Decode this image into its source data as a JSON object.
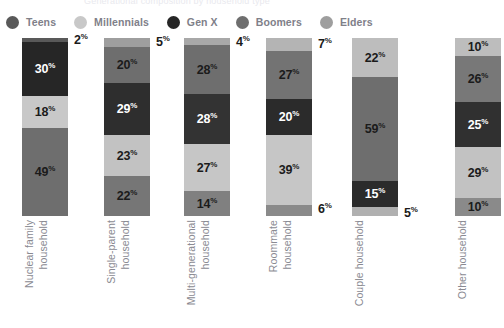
{
  "chart_data": {
    "type": "bar",
    "subtype": "stacked-100-vertical",
    "title": "Generational composition by household type",
    "xlabel": "",
    "ylabel": "",
    "ylim": [
      0,
      100
    ],
    "grid": false,
    "legend_position": "top-left",
    "units": "%",
    "categories": [
      "Nuclear family household",
      "Single-parent household",
      "Multi-generational household",
      "Roommate household",
      "Couple household",
      "Other household"
    ],
    "category_lines": [
      [
        "Nuclear family",
        "household"
      ],
      [
        "Single-parent",
        "household"
      ],
      [
        "Multi-generational",
        "household"
      ],
      [
        "Roommate",
        "household"
      ],
      [
        "Couple household"
      ],
      [
        "Other household"
      ]
    ],
    "series": [
      {
        "name": "Teens",
        "color": "#595959",
        "values": [
          2,
          5,
          4,
          7,
          0,
          10
        ]
      },
      {
        "name": "Millennials",
        "color": "#c8c8c8",
        "values": [
          18,
          23,
          27,
          39,
          22,
          29
        ]
      },
      {
        "name": "Gen X",
        "color": "#262626",
        "values": [
          30,
          29,
          28,
          20,
          15,
          25
        ]
      },
      {
        "name": "Boomers",
        "color": "#6e6e6e",
        "values": [
          49,
          20,
          28,
          27,
          59,
          26
        ]
      },
      {
        "name": "Elders",
        "color": "#9e9e9e",
        "values": [
          0,
          22,
          14,
          6,
          5,
          10
        ]
      }
    ],
    "stacks": [
      {
        "category": "Nuclear family household",
        "segments": [
          {
            "series": "Teens",
            "value": 2,
            "label": "2",
            "color": "#595959",
            "label_inside": false,
            "label_color": "dark"
          },
          {
            "series": "Gen X",
            "value": 30,
            "label": "30",
            "color": "#262626",
            "label_inside": true,
            "label_color": "light"
          },
          {
            "series": "Millennials",
            "value": 18,
            "label": "18",
            "color": "#c8c8c8",
            "label_inside": true,
            "label_color": "dark"
          },
          {
            "series": "Boomers",
            "value": 49,
            "label": "49",
            "color": "#6e6e6e",
            "label_inside": true,
            "label_color": "dark"
          }
        ]
      },
      {
        "category": "Single-parent household",
        "segments": [
          {
            "series": "Teens",
            "value": 5,
            "label": "5",
            "color": "#9e9e9e",
            "label_inside": false,
            "label_color": "dark"
          },
          {
            "series": "Boomers",
            "value": 20,
            "label": "20",
            "color": "#6e6e6e",
            "label_inside": true,
            "label_color": "dark"
          },
          {
            "series": "Gen X",
            "value": 29,
            "label": "29",
            "color": "#2e2e2e",
            "label_inside": true,
            "label_color": "light"
          },
          {
            "series": "Millennials",
            "value": 23,
            "label": "23",
            "color": "#c2c2c2",
            "label_inside": true,
            "label_color": "dark"
          },
          {
            "series": "Elders",
            "value": 22,
            "label": "22",
            "color": "#767676",
            "label_inside": true,
            "label_color": "dark"
          }
        ]
      },
      {
        "category": "Multi-generational household",
        "segments": [
          {
            "series": "Teens",
            "value": 4,
            "label": "4",
            "color": "#a8a8a8",
            "label_inside": false,
            "label_color": "dark"
          },
          {
            "series": "Boomers",
            "value": 28,
            "label": "28",
            "color": "#6e6e6e",
            "label_inside": true,
            "label_color": "dark"
          },
          {
            "series": "Gen X",
            "value": 28,
            "label": "28",
            "color": "#333333",
            "label_inside": true,
            "label_color": "light"
          },
          {
            "series": "Millennials",
            "value": 27,
            "label": "27",
            "color": "#c6c6c6",
            "label_inside": true,
            "label_color": "dark"
          },
          {
            "series": "Elders",
            "value": 14,
            "label": "14",
            "color": "#808080",
            "label_inside": true,
            "label_color": "dark"
          }
        ]
      },
      {
        "category": "Roommate household",
        "segments": [
          {
            "series": "Teens",
            "value": 7,
            "label": "7",
            "color": "#b4b4b4",
            "label_inside": false,
            "label_color": "dark"
          },
          {
            "series": "Boomers",
            "value": 27,
            "label": "27",
            "color": "#737373",
            "label_inside": true,
            "label_color": "dark"
          },
          {
            "series": "Gen X",
            "value": 20,
            "label": "20",
            "color": "#2b2b2b",
            "label_inside": true,
            "label_color": "light"
          },
          {
            "series": "Millennials",
            "value": 39,
            "label": "39",
            "color": "#c6c6c6",
            "label_inside": true,
            "label_color": "dark"
          },
          {
            "series": "Elders",
            "value": 6,
            "label": "6",
            "color": "#8a8a8a",
            "label_inside": false,
            "label_color": "dark"
          }
        ]
      },
      {
        "category": "Couple household",
        "segments": [
          {
            "series": "Millennials",
            "value": 22,
            "label": "22",
            "color": "#bdbdbd",
            "label_inside": true,
            "label_color": "dark"
          },
          {
            "series": "Boomers",
            "value": 59,
            "label": "59",
            "color": "#6e6e6e",
            "label_inside": true,
            "label_color": "dark"
          },
          {
            "series": "Gen X",
            "value": 15,
            "label": "15",
            "color": "#2b2b2b",
            "label_inside": true,
            "label_color": "light"
          },
          {
            "series": "Elders",
            "value": 5,
            "label": "5",
            "color": "#b0b0b0",
            "label_inside": false,
            "label_color": "dark"
          }
        ]
      },
      {
        "category": "Other household",
        "segments": [
          {
            "series": "Teens",
            "value": 10,
            "label": "10",
            "color": "#bdbdbd",
            "label_inside": true,
            "label_color": "dark"
          },
          {
            "series": "Boomers",
            "value": 26,
            "label": "26",
            "color": "#787878",
            "label_inside": true,
            "label_color": "dark"
          },
          {
            "series": "Gen X",
            "value": 25,
            "label": "25",
            "color": "#303030",
            "label_inside": true,
            "label_color": "light"
          },
          {
            "series": "Millennials",
            "value": 29,
            "label": "29",
            "color": "#c2c2c2",
            "label_inside": true,
            "label_color": "dark"
          },
          {
            "series": "Elders",
            "value": 10,
            "label": "10",
            "color": "#8a8a8a",
            "label_inside": true,
            "label_color": "dark"
          }
        ]
      }
    ]
  },
  "legend": {
    "items": [
      {
        "label": "Teens",
        "color": "#595959"
      },
      {
        "label": "Millennials",
        "color": "#c8c8c8"
      },
      {
        "label": "Gen X",
        "color": "#262626"
      },
      {
        "label": "Boomers",
        "color": "#6e6e6e"
      },
      {
        "label": "Elders",
        "color": "#9e9e9e"
      }
    ]
  },
  "percent_symbol": "%"
}
